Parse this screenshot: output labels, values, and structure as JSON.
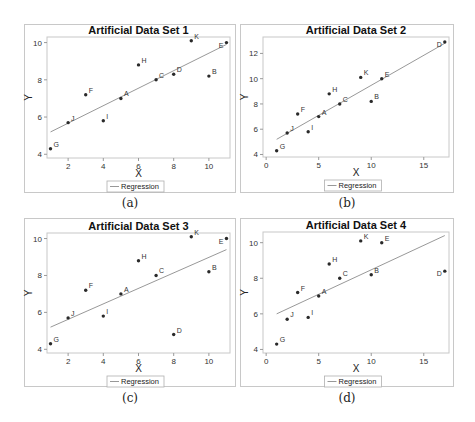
{
  "figure": {
    "captions": [
      "(a)",
      "(b)",
      "(c)",
      "(d)"
    ]
  },
  "chart_data": [
    {
      "type": "scatter",
      "title": "Artificial Data Set 1",
      "xlabel": "X",
      "ylabel": "Y",
      "xlim": [
        0.8,
        11.2
      ],
      "ylim": [
        3.8,
        10.3
      ],
      "xticks": [
        2,
        4,
        6,
        8,
        10
      ],
      "yticks": [
        4,
        6,
        8,
        10
      ],
      "grid": false,
      "legend": {
        "entries": [
          "Regression"
        ],
        "position": "bottom-center"
      },
      "points": [
        {
          "label": "A",
          "x": 5,
          "y": 7.0
        },
        {
          "label": "B",
          "x": 10,
          "y": 8.2
        },
        {
          "label": "C",
          "x": 7,
          "y": 8.0
        },
        {
          "label": "D",
          "x": 8,
          "y": 8.3
        },
        {
          "label": "E",
          "x": 11,
          "y": 10.0
        },
        {
          "label": "F",
          "x": 3,
          "y": 7.2
        },
        {
          "label": "G",
          "x": 1,
          "y": 4.3
        },
        {
          "label": "H",
          "x": 6,
          "y": 8.8
        },
        {
          "label": "I",
          "x": 4,
          "y": 5.8
        },
        {
          "label": "J",
          "x": 2,
          "y": 5.7
        },
        {
          "label": "K",
          "x": 9,
          "y": 10.1
        }
      ],
      "regression": {
        "x0": 1,
        "y0": 5.2,
        "x1": 11,
        "y1": 9.9
      },
      "caption": "(a)"
    },
    {
      "type": "scatter",
      "title": "Artificial Data Set 2",
      "xlabel": "X",
      "ylabel": "Y",
      "xlim": [
        -0.3,
        17.4
      ],
      "ylim": [
        3.8,
        13.3
      ],
      "xticks": [
        0,
        5,
        10,
        15
      ],
      "yticks": [
        4,
        6,
        8,
        10,
        12
      ],
      "grid": false,
      "legend": {
        "entries": [
          "Regression"
        ],
        "position": "bottom-center"
      },
      "points": [
        {
          "label": "A",
          "x": 5,
          "y": 7.0
        },
        {
          "label": "B",
          "x": 10,
          "y": 8.2
        },
        {
          "label": "C",
          "x": 7,
          "y": 8.0
        },
        {
          "label": "D",
          "x": 17,
          "y": 12.9
        },
        {
          "label": "E",
          "x": 11,
          "y": 10.0
        },
        {
          "label": "F",
          "x": 3,
          "y": 7.2
        },
        {
          "label": "G",
          "x": 1,
          "y": 4.3
        },
        {
          "label": "H",
          "x": 6,
          "y": 8.8
        },
        {
          "label": "I",
          "x": 4,
          "y": 5.8
        },
        {
          "label": "J",
          "x": 2,
          "y": 5.7
        },
        {
          "label": "K",
          "x": 9,
          "y": 10.1
        }
      ],
      "regression": {
        "x0": 1,
        "y0": 5.2,
        "x1": 17,
        "y1": 12.8
      },
      "caption": "(b)"
    },
    {
      "type": "scatter",
      "title": "Artificial Data Set 3",
      "xlabel": "X",
      "ylabel": "Y",
      "xlim": [
        0.8,
        11.2
      ],
      "ylim": [
        3.8,
        10.3
      ],
      "xticks": [
        2,
        4,
        6,
        8,
        10
      ],
      "yticks": [
        4,
        6,
        8,
        10
      ],
      "grid": false,
      "legend": {
        "entries": [
          "Regression"
        ],
        "position": "bottom-center"
      },
      "points": [
        {
          "label": "A",
          "x": 5,
          "y": 7.0
        },
        {
          "label": "B",
          "x": 10,
          "y": 8.2
        },
        {
          "label": "C",
          "x": 7,
          "y": 8.0
        },
        {
          "label": "D",
          "x": 8,
          "y": 4.8
        },
        {
          "label": "E",
          "x": 11,
          "y": 10.0
        },
        {
          "label": "F",
          "x": 3,
          "y": 7.2
        },
        {
          "label": "G",
          "x": 1,
          "y": 4.3
        },
        {
          "label": "H",
          "x": 6,
          "y": 8.8
        },
        {
          "label": "I",
          "x": 4,
          "y": 5.8
        },
        {
          "label": "J",
          "x": 2,
          "y": 5.7
        },
        {
          "label": "K",
          "x": 9,
          "y": 10.1
        }
      ],
      "regression": {
        "x0": 1,
        "y0": 5.2,
        "x1": 11,
        "y1": 9.4
      },
      "caption": "(c)"
    },
    {
      "type": "scatter",
      "title": "Artificial Data Set 4",
      "xlabel": "X",
      "ylabel": "Y",
      "xlim": [
        -0.3,
        17.4
      ],
      "ylim": [
        3.8,
        10.6
      ],
      "xticks": [
        0,
        5,
        10,
        15
      ],
      "yticks": [
        4,
        6,
        8,
        10
      ],
      "grid": false,
      "legend": {
        "entries": [
          "Regression"
        ],
        "position": "bottom-center"
      },
      "points": [
        {
          "label": "A",
          "x": 5,
          "y": 7.0
        },
        {
          "label": "B",
          "x": 10,
          "y": 8.2
        },
        {
          "label": "C",
          "x": 7,
          "y": 8.0
        },
        {
          "label": "D",
          "x": 17,
          "y": 8.4
        },
        {
          "label": "E",
          "x": 11,
          "y": 10.0
        },
        {
          "label": "F",
          "x": 3,
          "y": 7.2
        },
        {
          "label": "G",
          "x": 1,
          "y": 4.3
        },
        {
          "label": "H",
          "x": 6,
          "y": 8.8
        },
        {
          "label": "I",
          "x": 4,
          "y": 5.8
        },
        {
          "label": "J",
          "x": 2,
          "y": 5.7
        },
        {
          "label": "K",
          "x": 9,
          "y": 10.1
        }
      ],
      "regression": {
        "x0": 1,
        "y0": 6.0,
        "x1": 17,
        "y1": 10.4
      },
      "caption": "(d)"
    }
  ],
  "layout": {
    "panels": [
      {
        "frame": [
          24,
          24,
          212,
          169
        ],
        "plot": [
          47,
          37,
          230,
          158
        ],
        "caption_y": 196
      },
      {
        "frame": [
          240,
          24,
          214,
          169
        ],
        "plot": [
          263,
          37,
          449,
          157
        ],
        "caption_y": 196
      },
      {
        "frame": [
          24,
          218,
          212,
          169
        ],
        "plot": [
          47,
          233,
          230,
          353
        ],
        "caption_y": 391
      },
      {
        "frame": [
          240,
          218,
          214,
          169
        ],
        "plot": [
          263,
          232,
          449,
          353
        ],
        "caption_y": 391
      }
    ],
    "colors": {
      "point": "#2a2a2a",
      "line": "#8c8c8c",
      "axis": "#9a9a9a",
      "frame": "#c8c8c8",
      "text": "#222222"
    }
  }
}
